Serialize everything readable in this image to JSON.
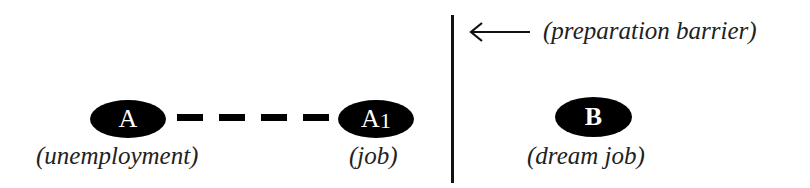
{
  "diagram": {
    "nodes": [
      {
        "id": "A",
        "letter": "A",
        "label": "(unemployment)"
      },
      {
        "id": "A1",
        "letter": "A",
        "subscript": "1",
        "label": "(job)"
      },
      {
        "id": "B",
        "letter": "B",
        "label": "(dream job)"
      }
    ],
    "connector": {
      "from": "A",
      "to": "A1",
      "style": "dashed",
      "dash_count": 4
    },
    "barrier": {
      "label": "(preparation barrier)",
      "arrow": "left-arrow"
    }
  }
}
